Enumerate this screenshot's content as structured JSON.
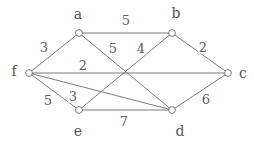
{
  "figure": {
    "kind": "weighted-undirected-graph-sketch",
    "background_color": "#ffffff",
    "stroke_color": "#6b6b6b",
    "text_color": "#5a5a5a",
    "width": 254,
    "height": 145
  },
  "chart_data": {
    "type": "diagram",
    "title": "",
    "xlabel": "",
    "ylabel": "",
    "nodes": [
      {
        "id": "a",
        "label": "a",
        "x": 79,
        "y": 33,
        "label_x": 78,
        "label_y": 14
      },
      {
        "id": "b",
        "label": "b",
        "x": 172,
        "y": 33,
        "label_x": 176,
        "label_y": 13
      },
      {
        "id": "c",
        "label": "c",
        "x": 228,
        "y": 73,
        "label_x": 243,
        "label_y": 73
      },
      {
        "id": "d",
        "label": "d",
        "x": 172,
        "y": 110,
        "label_x": 180,
        "label_y": 131
      },
      {
        "id": "e",
        "label": "e",
        "x": 79,
        "y": 110,
        "label_x": 78,
        "label_y": 131
      },
      {
        "id": "f",
        "label": "f",
        "x": 29,
        "y": 73,
        "label_x": 14,
        "label_y": 71
      }
    ],
    "edges": [
      {
        "source": "a",
        "target": "b",
        "weight": "5",
        "label_x": 126,
        "label_y": 20
      },
      {
        "source": "f",
        "target": "a",
        "weight": "3",
        "label_x": 44,
        "label_y": 47
      },
      {
        "source": "a",
        "target": "d",
        "weight": "5",
        "label_x": 113,
        "label_y": 48
      },
      {
        "source": "b",
        "target": "e",
        "weight": "4",
        "label_x": 141,
        "label_y": 48
      },
      {
        "source": "b",
        "target": "c",
        "weight": "2",
        "label_x": 203,
        "label_y": 47
      },
      {
        "source": "f",
        "target": "c",
        "weight": "2",
        "label_x": 83,
        "label_y": 65
      },
      {
        "source": "f",
        "target": "e",
        "weight": "5",
        "label_x": 48,
        "label_y": 100
      },
      {
        "source": "f",
        "target": "d",
        "weight": "3",
        "label_x": 73,
        "label_y": 96
      },
      {
        "source": "e",
        "target": "d",
        "weight": "7",
        "label_x": 124,
        "label_y": 121
      },
      {
        "source": "d",
        "target": "c",
        "weight": "6",
        "label_x": 206,
        "label_y": 99
      }
    ]
  }
}
